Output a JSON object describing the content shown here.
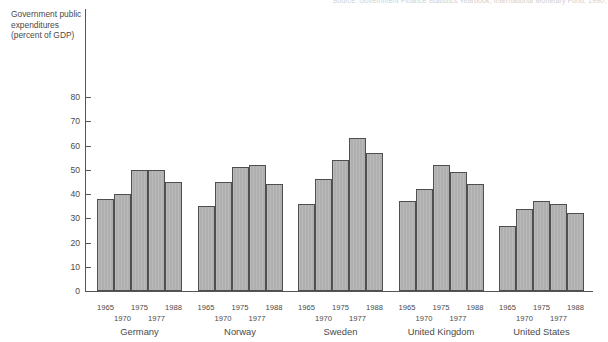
{
  "source_note": "Source: Government Finance Statistics Yearbook, International Monetary Fund, 1990.",
  "chart_data": {
    "type": "bar",
    "title": "",
    "xlabel": "",
    "ylabel": "Government public expenditures (percent of GDP)",
    "ylim": [
      0,
      80
    ],
    "yticks": [
      0,
      10,
      20,
      30,
      40,
      50,
      60,
      70,
      80
    ],
    "ytick_labels": [
      "0",
      "10",
      "20",
      "30",
      "40",
      "50",
      "60",
      "70",
      "80"
    ],
    "grid": false,
    "legend": false,
    "categories": [
      "Germany",
      "Norway",
      "Sweden",
      "United Kingdom",
      "United States"
    ],
    "years": [
      "1965",
      "1970",
      "1975",
      "1977",
      "1988"
    ],
    "series": [
      {
        "name": "1965",
        "values": [
          38,
          35,
          36,
          37,
          27
        ]
      },
      {
        "name": "1970",
        "values": [
          40,
          45,
          46,
          42,
          34
        ]
      },
      {
        "name": "1975",
        "values": [
          50,
          51,
          54,
          52,
          37
        ]
      },
      {
        "name": "1977",
        "values": [
          50,
          52,
          63,
          49,
          36
        ]
      },
      {
        "name": "1988",
        "values": [
          45,
          44,
          57,
          44,
          32
        ]
      }
    ],
    "groups": [
      {
        "category": "Germany",
        "years": [
          "1965",
          "1970",
          "1975",
          "1977",
          "1988"
        ],
        "values": [
          38,
          40,
          50,
          50,
          45
        ]
      },
      {
        "category": "Norway",
        "years": [
          "1965",
          "1970",
          "1975",
          "1977",
          "1988"
        ],
        "values": [
          35,
          45,
          51,
          52,
          44
        ]
      },
      {
        "category": "Sweden",
        "years": [
          "1965",
          "1970",
          "1975",
          "1977",
          "1988"
        ],
        "values": [
          36,
          46,
          54,
          63,
          57
        ]
      },
      {
        "category": "United Kingdom",
        "years": [
          "1965",
          "1970",
          "1975",
          "1977",
          "1988"
        ],
        "values": [
          37,
          42,
          52,
          49,
          44
        ]
      },
      {
        "category": "United States",
        "years": [
          "1965",
          "1970",
          "1975",
          "1977",
          "1988"
        ],
        "values": [
          27,
          34,
          37,
          36,
          32
        ]
      }
    ],
    "colors": {
      "bar_fill": "#b2b2b2",
      "bar_border": "#4f4f4f",
      "axis": "#555555",
      "text": "#4a4a4a",
      "background": "#ffffff"
    }
  }
}
